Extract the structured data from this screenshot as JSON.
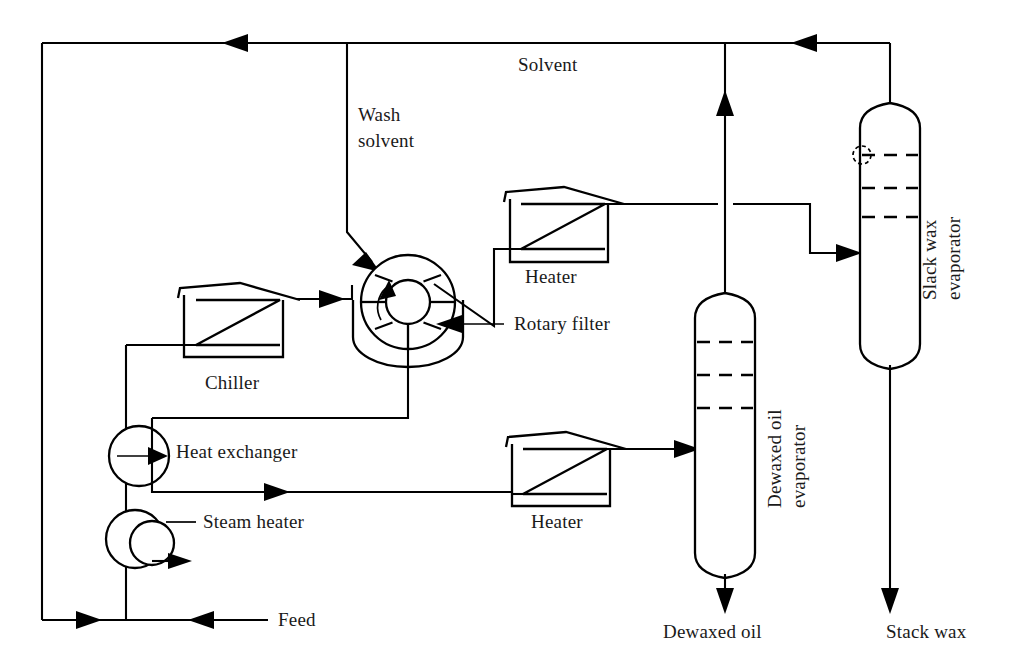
{
  "diagram": {
    "type": "process-flow-diagram",
    "background_color": "#ffffff",
    "line_color": "#000000",
    "text_color": "#1a1a1a"
  },
  "labels": {
    "solvent": "Solvent",
    "wash_solvent_line1": "Wash",
    "wash_solvent_line2": "solvent",
    "heater_top": "Heater",
    "heater_bottom": "Heater",
    "rotary_filter": "Rotary filter",
    "chiller": "Chiller",
    "heat_exchanger": "Heat exchanger",
    "steam_heater": "Steam heater",
    "feed": "Feed",
    "dewaxed_oil_evaporator_line1": "Dewaxed oil",
    "dewaxed_oil_evaporator_line2": "evaporator",
    "slack_wax_evaporator_line1": "Slack wax",
    "slack_wax_evaporator_line2": "evaporator",
    "dewaxed_oil_product": "Dewaxed oil",
    "stack_wax_product": "Stack wax"
  },
  "equipment": [
    {
      "id": "chiller",
      "name": "Chiller",
      "symbol": "heater-house-zigzag"
    },
    {
      "id": "rotary-filter",
      "name": "Rotary filter",
      "symbol": "rotary-drum-filter"
    },
    {
      "id": "heater-top",
      "name": "Heater",
      "symbol": "heater-house-zigzag"
    },
    {
      "id": "heater-bottom",
      "name": "Heater",
      "symbol": "heater-house-zigzag"
    },
    {
      "id": "heat-exchanger",
      "name": "Heat exchanger",
      "symbol": "circle-with-arrow"
    },
    {
      "id": "steam-heater",
      "name": "Steam heater",
      "symbol": "double-circle"
    },
    {
      "id": "dewaxed-oil-evaporator",
      "name": "Dewaxed oil evaporator",
      "symbol": "vertical-column",
      "trays": 3
    },
    {
      "id": "slack-wax-evaporator",
      "name": "Slack wax evaporator",
      "symbol": "vertical-column",
      "trays": 3
    }
  ],
  "streams": [
    {
      "id": "feed",
      "name": "Feed",
      "direction": "inlet"
    },
    {
      "id": "wash-solvent",
      "name": "Wash solvent",
      "direction": "inlet"
    },
    {
      "id": "solvent-recycle",
      "name": "Solvent",
      "direction": "recycle"
    },
    {
      "id": "dewaxed-oil",
      "name": "Dewaxed oil",
      "direction": "product"
    },
    {
      "id": "stack-wax",
      "name": "Stack wax",
      "direction": "product"
    }
  ]
}
